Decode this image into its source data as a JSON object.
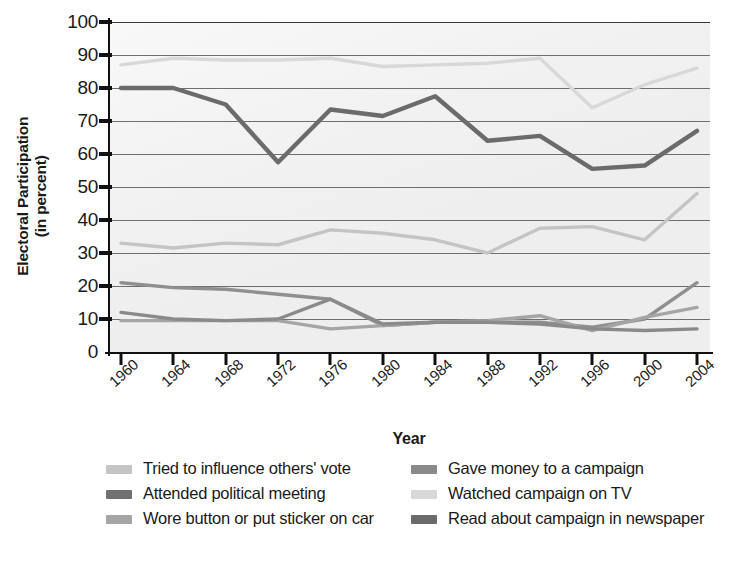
{
  "chart_data": {
    "type": "line",
    "title": "",
    "xlabel": "Year",
    "ylabel": "Electoral Participation (in percent)",
    "ylabel_line1": "Electoral Participation",
    "ylabel_line2": "(in percent)",
    "x": [
      1960,
      1964,
      1968,
      1972,
      1976,
      1980,
      1984,
      1988,
      1992,
      1996,
      2000,
      2004
    ],
    "categories": [
      "1960",
      "1964",
      "1968",
      "1972",
      "1976",
      "1980",
      "1984",
      "1988",
      "1992",
      "1996",
      "2000",
      "2004"
    ],
    "yticks": [
      0,
      10,
      20,
      30,
      40,
      50,
      60,
      70,
      80,
      90,
      100
    ],
    "ylim": [
      0,
      100
    ],
    "grid": true,
    "legend_position": "bottom",
    "series": [
      {
        "name": "Tried to influence others' vote",
        "color": "#c4c4c4",
        "values": [
          33,
          31.5,
          33,
          32.5,
          37,
          36,
          34,
          30,
          37.5,
          38,
          34,
          48
        ]
      },
      {
        "name": "Attended political meeting",
        "color": "#8f8f8f",
        "values": [
          21,
          19.5,
          19,
          17.5,
          16,
          8,
          9,
          9,
          9,
          7.5,
          10,
          21
        ]
      },
      {
        "name": "Wore button or put sticker on car",
        "color": "#a5a5a5",
        "values": [
          9.5,
          9.5,
          9.5,
          9.5,
          7,
          8,
          9,
          9.5,
          11,
          6.5,
          10.5,
          13.5
        ]
      },
      {
        "name": "Gave money to a campaign",
        "color": "#8a8a8a",
        "values": [
          12,
          10,
          9.5,
          10,
          16,
          8.5,
          9,
          9,
          8.5,
          7,
          6.5,
          7
        ]
      },
      {
        "name": "Watched campaign on TV",
        "color": "#d8d8d8",
        "values": [
          87,
          89,
          88.5,
          88.5,
          89,
          86.5,
          87,
          87.5,
          89,
          74,
          81,
          86
        ]
      },
      {
        "name": "Read about campaign in newspaper",
        "color": "#6b6b6b",
        "values": [
          80,
          80,
          75,
          57.5,
          73.5,
          71.5,
          77.5,
          64,
          65.5,
          55.5,
          56.5,
          67
        ]
      }
    ]
  },
  "legend": {
    "left": [
      {
        "label": "Tried to influence others' vote",
        "color": "#c4c4c4"
      },
      {
        "label": "Attended political meeting",
        "color": "#707070"
      },
      {
        "label": "Wore button or put sticker on car",
        "color": "#a5a5a5"
      }
    ],
    "right": [
      {
        "label": "Gave money to a campaign",
        "color": "#8a8a8a"
      },
      {
        "label": "Watched campaign on TV",
        "color": "#d8d8d8"
      },
      {
        "label": "Read about campaign in newspaper",
        "color": "#6b6b6b"
      }
    ]
  }
}
